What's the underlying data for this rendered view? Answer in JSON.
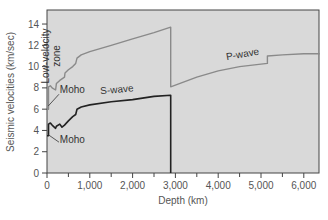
{
  "chart_data": {
    "type": "line",
    "title": "",
    "xlabel": "Depth (km)",
    "ylabel": "Seismic velocities (km/sec)",
    "xlim": [
      0,
      6371
    ],
    "ylim": [
      0,
      15
    ],
    "x_ticks": [
      0,
      1000,
      2000,
      3000,
      4000,
      5000,
      6000
    ],
    "x_tick_labels": [
      "0",
      "1,000",
      "2,000",
      "3,000",
      "4,000",
      "5,000",
      "6,000"
    ],
    "y_ticks": [
      0,
      2,
      4,
      6,
      8,
      10,
      12,
      14
    ],
    "y_tick_labels": [
      "0",
      "2",
      "4",
      "6",
      "8",
      "10",
      "12",
      "14"
    ],
    "grid": false,
    "legend": "none",
    "plot_background": "#d9d9d9",
    "series": [
      {
        "name": "P-wave",
        "color": "#8a8a8a",
        "points": [
          [
            0,
            6.0
          ],
          [
            35,
            6.0
          ],
          [
            35,
            8.1
          ],
          [
            80,
            8.2
          ],
          [
            120,
            8.0
          ],
          [
            200,
            7.8
          ],
          [
            220,
            8.4
          ],
          [
            300,
            8.7
          ],
          [
            410,
            9.0
          ],
          [
            420,
            9.4
          ],
          [
            500,
            9.7
          ],
          [
            600,
            10.0
          ],
          [
            670,
            10.3
          ],
          [
            700,
            10.8
          ],
          [
            800,
            11.1
          ],
          [
            1000,
            11.4
          ],
          [
            1500,
            12.0
          ],
          [
            2000,
            12.6
          ],
          [
            2500,
            13.2
          ],
          [
            2890,
            13.7
          ],
          [
            2890,
            8.1
          ],
          [
            3500,
            9.0
          ],
          [
            4000,
            9.6
          ],
          [
            4500,
            10.0
          ],
          [
            5150,
            10.3
          ],
          [
            5150,
            11.0
          ],
          [
            5500,
            11.1
          ],
          [
            6000,
            11.2
          ],
          [
            6371,
            11.2
          ]
        ]
      },
      {
        "name": "S-wave",
        "color": "#222222",
        "points": [
          [
            0,
            3.5
          ],
          [
            35,
            3.5
          ],
          [
            35,
            4.6
          ],
          [
            80,
            4.7
          ],
          [
            120,
            4.5
          ],
          [
            200,
            4.2
          ],
          [
            220,
            4.4
          ],
          [
            300,
            4.6
          ],
          [
            350,
            4.3
          ],
          [
            410,
            4.5
          ],
          [
            500,
            4.9
          ],
          [
            600,
            5.3
          ],
          [
            670,
            5.5
          ],
          [
            700,
            6.0
          ],
          [
            800,
            6.2
          ],
          [
            1000,
            6.4
          ],
          [
            1500,
            6.7
          ],
          [
            2000,
            6.9
          ],
          [
            2500,
            7.2
          ],
          [
            2890,
            7.3
          ],
          [
            2890,
            0
          ]
        ]
      }
    ],
    "annotations": [
      {
        "text": "Low-velocity zone",
        "x": 150,
        "y": 11,
        "rotation": -90
      },
      {
        "text": "Moho",
        "x": 300,
        "y": 7.5
      },
      {
        "text": "Moho",
        "x": 300,
        "y": 2.8
      },
      {
        "text": "S-wave",
        "x": 1250,
        "y": 7.4
      },
      {
        "text": "P-wave",
        "x": 4200,
        "y": 10.6
      }
    ]
  }
}
